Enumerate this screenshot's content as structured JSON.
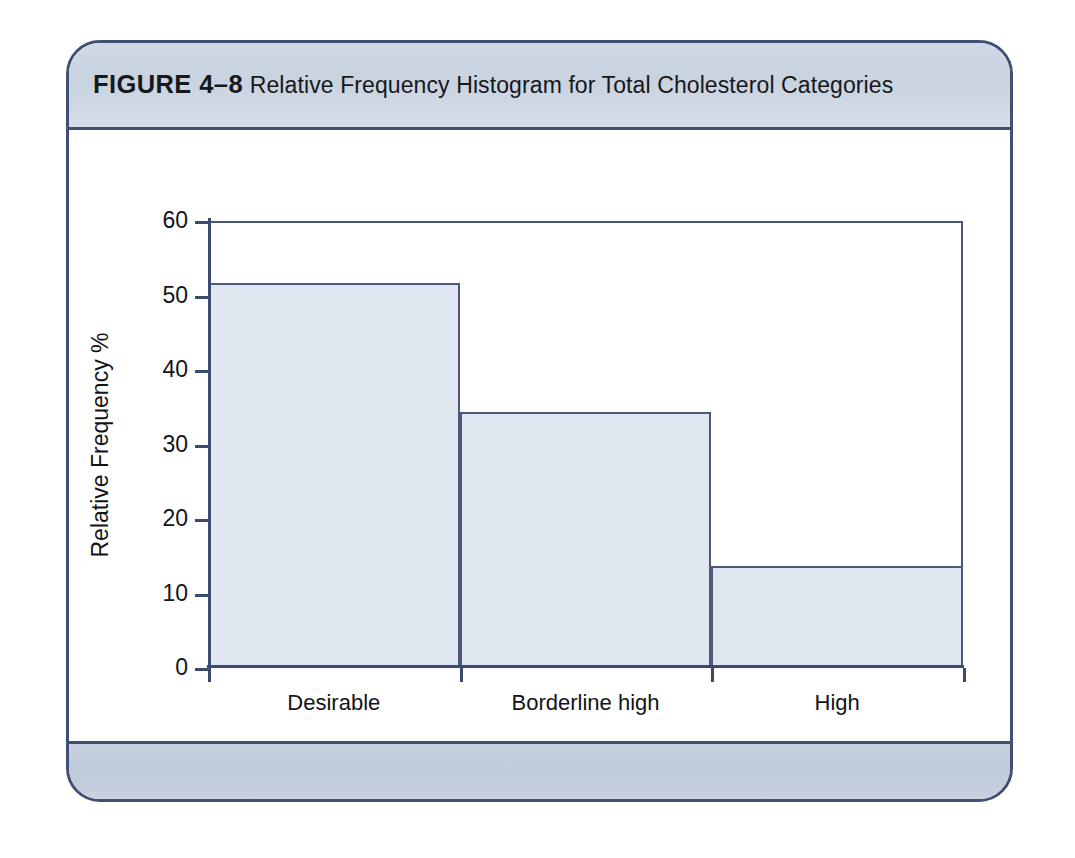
{
  "figure": {
    "label": "FIGURE 4–8",
    "caption": "Relative Frequency Histogram for Total Cholesterol Categories",
    "frame_border_color": "#414f72",
    "header_band_color": "#cbd5e1",
    "footer_band_color": "#c3ced d"
  },
  "colors": {
    "bar_fill": "#e1e7f0",
    "bar_border": "#4b577b",
    "axis": "#3c4a6e",
    "text": "#121417",
    "plot_rule": "#49557a"
  },
  "chart_data": {
    "type": "bar",
    "title": "Relative Frequency Histogram for Total Cholesterol Categories",
    "categories": [
      "Desirable",
      "Borderline high",
      "High"
    ],
    "values": [
      51.7,
      34.4,
      13.7
    ],
    "xlabel": "Total Cholesterol",
    "ylabel": "Relative Frequency %",
    "ylim": [
      0,
      60
    ],
    "yticks": [
      0,
      10,
      20,
      30,
      40,
      50,
      60
    ],
    "ytick_labels": [
      "0",
      "10",
      "20",
      "30",
      "40",
      "50",
      "60"
    ],
    "grid": false,
    "legend": null,
    "bar_gap": 0,
    "orientation": "vertical"
  }
}
